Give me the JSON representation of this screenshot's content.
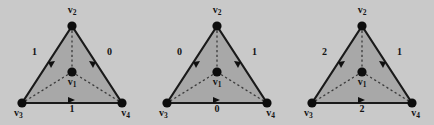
{
  "figure": {
    "background_color": "#c9c9c9",
    "triangle_fill": "#a8a8a8",
    "stroke_color": "#1a1a1a",
    "vertex_labels": {
      "apex": "v2",
      "center": "v1",
      "bottom_left": "v3",
      "bottom_right": "v4"
    },
    "vertex_label_text": {
      "apex": "v",
      "apex_sub": "2",
      "center": "v",
      "center_sub": "1",
      "bottom_left": "v",
      "bottom_left_sub": "3",
      "bottom_right": "v",
      "bottom_right_sub": "4"
    },
    "panels": [
      {
        "id": "panel-1",
        "edge_weights": {
          "left": "1",
          "right": "0",
          "bottom": "1"
        },
        "edge_directions": {
          "left": "v2-to-v3",
          "right": "v2-to-v4",
          "bottom": "v3-to-v4"
        }
      },
      {
        "id": "panel-2",
        "edge_weights": {
          "left": "0",
          "right": "1",
          "bottom": "0"
        },
        "edge_directions": {
          "left": "v2-to-v3",
          "right": "v2-to-v4",
          "bottom": "v3-to-v4"
        }
      },
      {
        "id": "panel-3",
        "edge_weights": {
          "left": "2",
          "right": "1",
          "bottom": "2"
        },
        "edge_directions": {
          "left": "v2-to-v3",
          "right": "v2-to-v4",
          "bottom": "v3-to-v4"
        }
      }
    ]
  }
}
